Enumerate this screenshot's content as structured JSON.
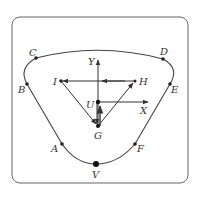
{
  "diagram": {
    "colors": {
      "stroke": "#444444",
      "frame": "#666666",
      "label": "#333333",
      "background": "#ffffff"
    },
    "points": {
      "A": {
        "label": "A",
        "x": 62,
        "y": 144
      },
      "B": {
        "label": "B",
        "x": 27,
        "y": 84
      },
      "C": {
        "label": "C",
        "x": 36,
        "y": 58
      },
      "D": {
        "label": "D",
        "x": 163,
        "y": 59
      },
      "E": {
        "label": "E",
        "x": 170,
        "y": 84
      },
      "F": {
        "label": "F",
        "x": 135,
        "y": 144
      },
      "V": {
        "label": "V",
        "x": 96,
        "y": 164
      },
      "I": {
        "label": "I",
        "x": 61,
        "y": 81
      },
      "H": {
        "label": "H",
        "x": 135,
        "y": 81
      },
      "U": {
        "label": "U",
        "x": 98,
        "y": 102
      },
      "G": {
        "label": "G",
        "x": 98,
        "y": 126
      }
    },
    "axes": {
      "x_label": "X",
      "y_label": "Y"
    },
    "vectors": [
      {
        "from": "G",
        "to": "I"
      },
      {
        "from": "G",
        "to": "H"
      },
      {
        "from": "H",
        "to": "I"
      },
      {
        "from": "G",
        "to": "U"
      },
      {
        "from": "U",
        "to": "G"
      }
    ]
  }
}
